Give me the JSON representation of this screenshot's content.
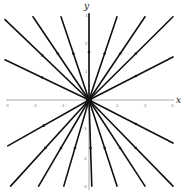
{
  "chart_data": {
    "type": "line",
    "title": "",
    "subtitle": "Phase portrait: star node (unstable, trajectories radiate from origin)",
    "xlabel": "x",
    "ylabel": "y",
    "xlim": [
      -3,
      3
    ],
    "ylim": [
      -3,
      3
    ],
    "x_ticks": [
      -3,
      -2,
      -1,
      1,
      2,
      3
    ],
    "y_ticks": [
      -3,
      -2,
      -1,
      1,
      2,
      3
    ],
    "grid": false,
    "legend": null,
    "origin": [
      0,
      0
    ],
    "direction": "outward",
    "series": [
      {
        "name": "ray-1",
        "x": [
          0,
          -3.0
        ],
        "y": [
          0,
          2.8
        ]
      },
      {
        "name": "ray-2",
        "x": [
          0,
          -2.0
        ],
        "y": [
          0,
          2.9
        ]
      },
      {
        "name": "ray-3",
        "x": [
          0,
          -1.0
        ],
        "y": [
          0,
          2.9
        ]
      },
      {
        "name": "ray-4",
        "x": [
          0,
          0.0
        ],
        "y": [
          0,
          3.0
        ]
      },
      {
        "name": "ray-5",
        "x": [
          0,
          1.0
        ],
        "y": [
          0,
          2.9
        ]
      },
      {
        "name": "ray-6",
        "x": [
          0,
          2.0
        ],
        "y": [
          0,
          2.9
        ]
      },
      {
        "name": "ray-7",
        "x": [
          0,
          3.0
        ],
        "y": [
          0,
          2.9
        ]
      },
      {
        "name": "ray-8",
        "x": [
          0,
          3.0
        ],
        "y": [
          0,
          1.5
        ]
      },
      {
        "name": "ray-9",
        "x": [
          0,
          -3.0
        ],
        "y": [
          0,
          1.4
        ]
      },
      {
        "name": "ray-10",
        "x": [
          0,
          -2.9
        ],
        "y": [
          0,
          -1.6
        ]
      },
      {
        "name": "ray-11",
        "x": [
          0,
          -2.8
        ],
        "y": [
          0,
          -3.0
        ]
      },
      {
        "name": "ray-12",
        "x": [
          0,
          -1.8
        ],
        "y": [
          0,
          -3.0
        ]
      },
      {
        "name": "ray-13",
        "x": [
          0,
          -0.9
        ],
        "y": [
          0,
          -3.0
        ]
      },
      {
        "name": "ray-14",
        "x": [
          0,
          0.1
        ],
        "y": [
          0,
          -3.0
        ]
      },
      {
        "name": "ray-15",
        "x": [
          0,
          1.0
        ],
        "y": [
          0,
          -3.0
        ]
      },
      {
        "name": "ray-16",
        "x": [
          0,
          2.0
        ],
        "y": [
          0,
          -3.0
        ]
      },
      {
        "name": "ray-17",
        "x": [
          0,
          3.0
        ],
        "y": [
          0,
          -3.0
        ]
      },
      {
        "name": "ray-18",
        "x": [
          0,
          3.0
        ],
        "y": [
          0,
          -1.5
        ]
      }
    ]
  },
  "axes": {
    "x_label": "x",
    "y_label": "y"
  },
  "ticks": {
    "x": [
      "-3",
      "-2",
      "-1",
      "1",
      "2",
      "3"
    ],
    "y": [
      "3",
      "2",
      "1",
      "-1",
      "-2",
      "-3"
    ]
  }
}
